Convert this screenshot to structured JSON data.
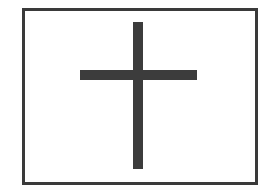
{
  "figure": {
    "shape": "cross-in-rectangle",
    "colors": {
      "frame": "#3a3a3a",
      "cross": "#3c3c3c",
      "background": "#ffffff"
    },
    "frame": {
      "x": 22,
      "y": 8,
      "width": 234,
      "height": 175,
      "stroke": 3
    },
    "cross": {
      "vertical_bar": {
        "x": 133,
        "y": 22,
        "width": 10,
        "height": 147
      },
      "horizontal_bar": {
        "x": 80,
        "y": 70,
        "width": 117,
        "height": 10
      }
    }
  }
}
